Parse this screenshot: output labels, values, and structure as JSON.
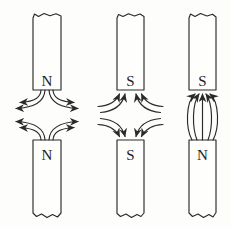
{
  "diagram": {
    "background_color": "#fdfdfb",
    "line_color": "#2a2a2a",
    "label_color": "#1c1c1c",
    "pairs": [
      {
        "id": "left",
        "top_pole": "N",
        "bottom_pole": "N",
        "interaction": "repulsion",
        "field_lines_per_magnet": 4,
        "arrow_direction": "outward away from both N poles"
      },
      {
        "id": "middle",
        "top_pole": "S",
        "bottom_pole": "S",
        "interaction": "repulsion",
        "field_lines_per_magnet": 4,
        "arrow_direction": "inward into both S poles"
      },
      {
        "id": "right",
        "top_pole": "S",
        "bottom_pole": "N",
        "interaction": "attraction",
        "field_lines_between": 5,
        "arrow_direction": "from N pole up into S pole"
      }
    ]
  }
}
